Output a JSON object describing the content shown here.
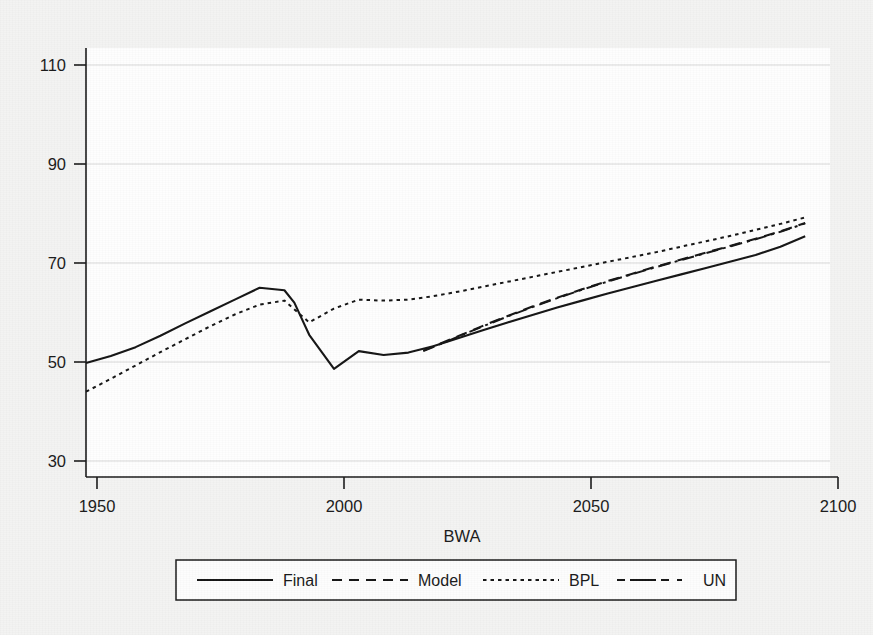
{
  "figure": {
    "background_color": "#f3f3f2",
    "plot_background_color": "#fefefe",
    "line_color": "#141414",
    "grid_color": "#d8d8d8"
  },
  "chart_data": {
    "type": "line",
    "title": "",
    "subtitle": "",
    "xlabel": "BWA",
    "ylabel": "",
    "xlim": [
      1950,
      2100
    ],
    "ylim": [
      25,
      115
    ],
    "xticks": [
      1950,
      2000,
      2050,
      2100
    ],
    "xtick_labels": [
      "1950",
      "2000",
      "2050",
      "2100"
    ],
    "yticks": [
      30,
      50,
      70,
      90,
      110
    ],
    "ytick_labels": [
      "30",
      "50",
      "70",
      "90",
      "110"
    ],
    "grid": "horizontal",
    "legend_position": "below-axes",
    "annotations": [],
    "series": [
      {
        "name": "Final",
        "style": "solid",
        "x": [
          1950,
          1955,
          1960,
          1965,
          1970,
          1975,
          1980,
          1985,
          1990,
          1992,
          1995,
          2000,
          2005,
          2010,
          2015,
          2020,
          2025,
          2030,
          2035,
          2040,
          2045,
          2050,
          2055,
          2060,
          2065,
          2070,
          2075,
          2080,
          2085,
          2090,
          2095
        ],
        "y": [
          49.8,
          51.2,
          53.0,
          55.3,
          57.8,
          60.2,
          62.6,
          65.0,
          64.5,
          62.0,
          55.5,
          48.6,
          52.2,
          51.4,
          51.9,
          53.2,
          54.8,
          56.4,
          58.0,
          59.5,
          61.0,
          62.4,
          63.8,
          65.1,
          66.4,
          67.7,
          69.0,
          70.3,
          71.6,
          73.3,
          75.4
        ]
      },
      {
        "name": "Model",
        "style": "dashed",
        "x": [
          2018,
          2025,
          2030,
          2035,
          2040,
          2045,
          2050,
          2055,
          2060,
          2065,
          2070,
          2075,
          2080,
          2085,
          2090,
          2095
        ],
        "y": [
          52.3,
          55.2,
          57.3,
          59.3,
          61.2,
          63.0,
          64.7,
          66.3,
          67.8,
          69.3,
          70.7,
          72.1,
          73.5,
          74.9,
          76.4,
          78.1
        ]
      },
      {
        "name": "BPL",
        "style": "dotted",
        "x": [
          1950,
          1955,
          1960,
          1965,
          1970,
          1975,
          1980,
          1985,
          1990,
          1995,
          2000,
          2005,
          2010,
          2015,
          2020,
          2025,
          2030,
          2035,
          2040,
          2045,
          2050,
          2055,
          2060,
          2065,
          2070,
          2075,
          2080,
          2085,
          2090,
          2095
        ],
        "y": [
          44.0,
          46.6,
          49.3,
          52.0,
          54.6,
          57.2,
          59.6,
          61.6,
          62.4,
          58.0,
          60.8,
          62.6,
          62.4,
          62.6,
          63.3,
          64.2,
          65.2,
          66.2,
          67.2,
          68.2,
          69.2,
          70.2,
          71.2,
          72.2,
          73.3,
          74.4,
          75.5,
          76.7,
          77.9,
          79.2
        ]
      },
      {
        "name": "UN",
        "style": "dashdot",
        "x": [
          2018,
          2025,
          2030,
          2035,
          2040,
          2045,
          2050,
          2055,
          2060,
          2065,
          2070,
          2075,
          2080,
          2085,
          2090,
          2095
        ],
        "y": [
          52.2,
          55.1,
          57.2,
          59.2,
          61.1,
          62.9,
          64.6,
          66.2,
          67.7,
          69.2,
          70.6,
          72.0,
          73.4,
          74.8,
          76.3,
          78.0
        ]
      }
    ]
  },
  "legend": {
    "entries": [
      {
        "label": "Final",
        "style": "solid"
      },
      {
        "label": "Model",
        "style": "dashed"
      },
      {
        "label": "BPL",
        "style": "dotted"
      },
      {
        "label": "UN",
        "style": "dashdot"
      }
    ]
  }
}
